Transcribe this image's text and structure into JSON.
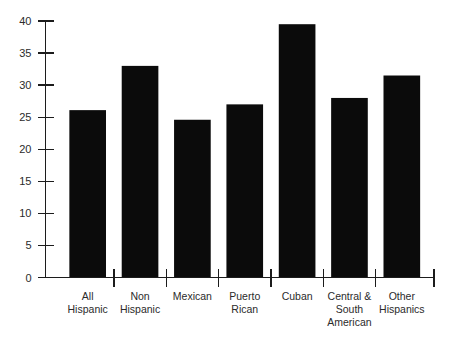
{
  "chart_data": {
    "type": "bar",
    "title": "",
    "subtitle": "",
    "xlabel": "",
    "ylabel": "",
    "ylim": [
      0,
      40
    ],
    "ytick_step": 5,
    "grid": false,
    "legend": false,
    "categories": [
      "All Hispanic",
      "Non Hispanic",
      "Mexican",
      "Puerto Rican",
      "Cuban",
      "Central & South American",
      "Other Hispanics"
    ],
    "category_lines": [
      [
        "All",
        "Hispanic"
      ],
      [
        "Non",
        "Hispanic"
      ],
      [
        "Mexican"
      ],
      [
        "Puerto",
        "Rican"
      ],
      [
        "Cuban"
      ],
      [
        "Central &",
        "South",
        "American"
      ],
      [
        "Other",
        "Hispanics"
      ]
    ],
    "values": [
      26.1,
      33.0,
      24.6,
      27.0,
      39.5,
      28.0,
      31.5
    ],
    "ytick_labels": [
      "0",
      "5",
      "10",
      "15",
      "20",
      "25",
      "30",
      "35",
      "40"
    ],
    "ytick_values": [
      0,
      5,
      10,
      15,
      20,
      25,
      30,
      35,
      40
    ],
    "bar_color": "#0b0b0b",
    "axis_color": "#1c1c1c",
    "background_color": "#ffffff"
  }
}
